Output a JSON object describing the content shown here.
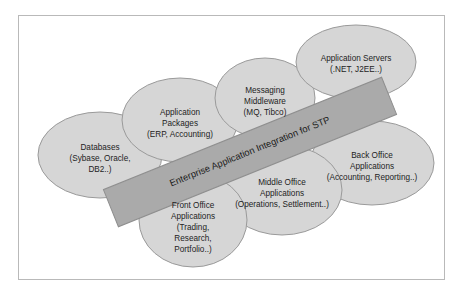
{
  "diagram": {
    "title": "Enterprise Application Integration for STP",
    "type": "venn-overlapping-ellipses-with-banner",
    "colors": {
      "ellipse_fill": "#d6d6d6",
      "ellipse_stroke": "#9a9a9a",
      "banner_fill": "#aaaaaa",
      "banner_stroke": "#8f8f8f",
      "frame_border": "#b9b9b9",
      "background": "#ffffff",
      "text": "#1d1d1d"
    },
    "banner": {
      "label": "Enterprise Application Integration for STP",
      "angle_deg": -22
    },
    "nodes": [
      {
        "id": "databases",
        "name": "Databases",
        "lines": [
          "Databases",
          "(Sybase, Oracle,",
          "DB2..)"
        ],
        "cx": 100,
        "cy": 155,
        "rx": 62,
        "ry": 43,
        "label_x": 100,
        "label_y": 148
      },
      {
        "id": "application-packages",
        "name": "Application Packages",
        "lines": [
          "Application",
          "Packages",
          "(ERP, Accounting)"
        ],
        "cx": 180,
        "cy": 120,
        "rx": 58,
        "ry": 42,
        "label_x": 180,
        "label_y": 113
      },
      {
        "id": "messaging-middleware",
        "name": "Messaging Middleware",
        "lines": [
          "Messaging",
          "Middleware",
          "(MQ, Tibco)"
        ],
        "cx": 265,
        "cy": 98,
        "rx": 50,
        "ry": 40,
        "label_x": 265,
        "label_y": 91
      },
      {
        "id": "application-servers",
        "name": "Application Servers",
        "lines": [
          "Application Servers",
          "(.NET, J2EE..)"
        ],
        "cx": 356,
        "cy": 62,
        "rx": 60,
        "ry": 37,
        "label_x": 356,
        "label_y": 59
      },
      {
        "id": "back-office-applications",
        "name": "Back Office Applications",
        "lines": [
          "Back Office",
          "Applications",
          "(Accounting, Reporting..)"
        ],
        "cx": 372,
        "cy": 163,
        "rx": 62,
        "ry": 42,
        "label_x": 372,
        "label_y": 156
      },
      {
        "id": "middle-office-applications",
        "name": "Middle Office Applications",
        "lines": [
          "Middle Office",
          "Applications",
          "(Operations, Settlement..)"
        ],
        "cx": 282,
        "cy": 190,
        "rx": 60,
        "ry": 45,
        "label_x": 282,
        "label_y": 183
      },
      {
        "id": "front-office-applications",
        "name": "Front Office Applications",
        "lines": [
          "Front Office",
          "Applications",
          "(Trading,",
          "Research,",
          "Portfolio..)"
        ],
        "cx": 193,
        "cy": 220,
        "rx": 54,
        "ry": 47,
        "label_x": 193,
        "label_y": 206
      }
    ]
  }
}
